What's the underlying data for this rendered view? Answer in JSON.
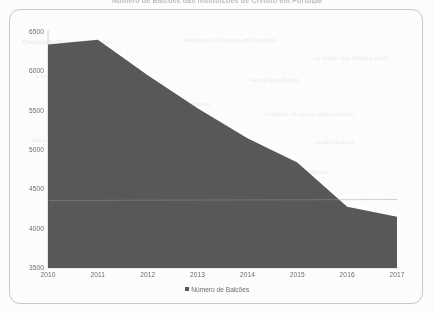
{
  "page": {
    "bleed_title": "Número de Balcões das Instituições de Crédito em Portugal",
    "background_color": "#ffffff",
    "frame_color": "#c9c9c9"
  },
  "ghost_text": [
    {
      "text": "Diminuição Número de Balcões",
      "x": 8,
      "y": 24
    },
    {
      "text": "distribuição bancária em Portugal",
      "x": 168,
      "y": 22
    },
    {
      "text": "ao longo dos últimos anos",
      "x": 300,
      "y": 40
    },
    {
      "text": "a rede de balcões tem vindo a reduzir",
      "x": 22,
      "y": 58
    },
    {
      "text": "tecnologia digital",
      "x": 236,
      "y": 62
    },
    {
      "text": "o encerramento de agências bancárias",
      "x": 90,
      "y": 86
    },
    {
      "text": "redução de custos operacionais",
      "x": 252,
      "y": 96
    },
    {
      "text": "entre 2010 e 2017",
      "x": 18,
      "y": 122
    },
    {
      "text": "canais digitais",
      "x": 300,
      "y": 124
    },
    {
      "text": "sector financeiro nacional",
      "x": 40,
      "y": 150
    },
    {
      "text": "número total de agências",
      "x": 244,
      "y": 154
    }
  ],
  "legend": {
    "label": "Número de Balcões",
    "swatch_color": "#595959",
    "position": "bottom-center"
  },
  "chart_data": {
    "type": "area",
    "title": "Número de Balcões",
    "xlabel": "",
    "ylabel": "",
    "categories": [
      "2010",
      "2011",
      "2012",
      "2013",
      "2014",
      "2015",
      "2016",
      "2017"
    ],
    "x": [
      2010,
      2011,
      2012,
      2013,
      2014,
      2015,
      2016,
      2017
    ],
    "values": [
      6340,
      6400,
      5950,
      5530,
      5150,
      4840,
      4280,
      4150
    ],
    "series": [
      {
        "name": "Número de Balcões",
        "color": "#595959",
        "values": [
          6340,
          6400,
          5950,
          5530,
          5150,
          4840,
          4280,
          4150
        ]
      }
    ],
    "ylim": [
      3500,
      6500
    ],
    "yticks": [
      3500,
      4000,
      4500,
      5000,
      5500,
      6000,
      6500
    ],
    "ytick_labels": [
      "3500",
      "4000",
      "4500",
      "5000",
      "5500",
      "6000",
      "6500"
    ],
    "xtick_labels": [
      "2010",
      "2011",
      "2012",
      "2013",
      "2014",
      "2015",
      "2016",
      "2017"
    ],
    "grid": false,
    "legend_position": "bottom",
    "fill_color": "#595959",
    "axis_color": "#d2d2d2",
    "tick_label_color": "#6e6e6e"
  }
}
